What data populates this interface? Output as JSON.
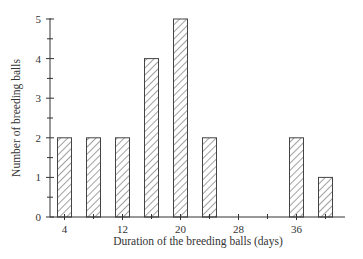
{
  "chart_data": {
    "type": "bar",
    "title": "",
    "xlabel": "Duration of the breeding balls (days)",
    "ylabel": "Number of breeding balls",
    "x": [
      4,
      8,
      12,
      16,
      20,
      24,
      28,
      32,
      36,
      40
    ],
    "values": [
      2,
      2,
      2,
      4,
      5,
      2,
      0,
      0,
      2,
      1
    ],
    "series": [
      {
        "name": "Breeding balls",
        "x": [
          4,
          8,
          12,
          16,
          20,
          24,
          36,
          40
        ],
        "values": [
          2,
          2,
          2,
          4,
          5,
          2,
          2,
          1
        ]
      }
    ],
    "x_tick_labels": [
      "4",
      "12",
      "20",
      "28",
      "36"
    ],
    "x_ticks": [
      4,
      12,
      20,
      28,
      36
    ],
    "y_tick_labels": [
      "0",
      "1",
      "2",
      "3",
      "4",
      "5"
    ],
    "ylim": [
      0,
      5
    ],
    "xlim": [
      2.5,
      43
    ],
    "grid": false,
    "legend": "none",
    "bar_fill": "diagonal hatch",
    "colors": {
      "axis": "#333333",
      "bar_stroke": "#444444",
      "hatch": "#444444"
    }
  }
}
